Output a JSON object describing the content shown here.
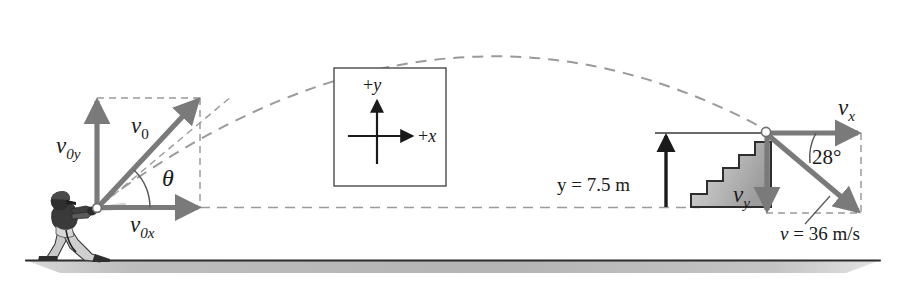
{
  "figure": {
    "colors": {
      "vector_gray": "#7a7a7a",
      "dashed_gray": "#9a9a9a",
      "black": "#1a1a1a",
      "ground_shade": "#b8b8b8",
      "stair_shade": "#b0b0b0",
      "background": "#ffffff"
    }
  },
  "launch": {
    "v0_label": "v",
    "v0_sub": "0",
    "v0y_label": "v",
    "v0y_sub": "0y",
    "v0x_label": "v",
    "v0x_sub": "0x",
    "theta_label": "θ"
  },
  "axes_inset": {
    "y_label": "+y",
    "x_label": "+x"
  },
  "landing": {
    "vx_label": "v",
    "vx_sub": "x",
    "vy_label": "v",
    "vy_sub": "y",
    "angle_label": "28°",
    "speed_label": "v = 36 m/s",
    "height_label": "y = 7.5 m"
  }
}
